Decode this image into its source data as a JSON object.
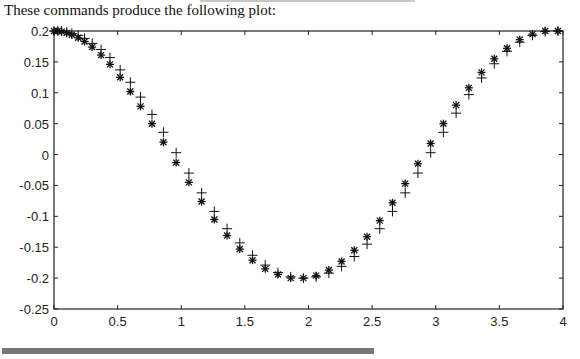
{
  "caption": "These commands produce the following plot:",
  "chart_data": {
    "type": "scatter",
    "title": "",
    "xlabel": "",
    "ylabel": "",
    "xlim": [
      0,
      4
    ],
    "ylim": [
      -0.25,
      0.2
    ],
    "grid": false,
    "legend": null,
    "x_ticks": [
      "0",
      "0.5",
      "1",
      "1.5",
      "2",
      "2.5",
      "3",
      "3.5",
      "4"
    ],
    "y_ticks": [
      "0.2",
      "0.15",
      "0.1",
      "0.05",
      "0",
      "-0.05",
      "-0.1",
      "-0.15",
      "-0.2",
      "-0.25"
    ],
    "series": [
      {
        "name": "star-markers",
        "marker": "*",
        "x": [
          0,
          0.03,
          0.06,
          0.1,
          0.14,
          0.19,
          0.24,
          0.3,
          0.37,
          0.44,
          0.52,
          0.6,
          0.68,
          0.77,
          0.86,
          0.96,
          1.06,
          1.16,
          1.26,
          1.36,
          1.46,
          1.56,
          1.66,
          1.76,
          1.86,
          1.96,
          2.06,
          2.16,
          2.26,
          2.36,
          2.46,
          2.56,
          2.66,
          2.76,
          2.86,
          2.96,
          3.06,
          3.16,
          3.26,
          3.36,
          3.46,
          3.56,
          3.66,
          3.76,
          3.86,
          3.96
        ],
        "y": [
          0.2,
          0.2,
          0.199,
          0.197,
          0.194,
          0.189,
          0.183,
          0.174,
          0.161,
          0.146,
          0.125,
          0.102,
          0.078,
          0.05,
          0.02,
          -0.013,
          -0.045,
          -0.076,
          -0.105,
          -0.131,
          -0.153,
          -0.171,
          -0.185,
          -0.194,
          -0.2,
          -0.2,
          -0.196,
          -0.187,
          -0.173,
          -0.155,
          -0.133,
          -0.107,
          -0.078,
          -0.047,
          -0.015,
          0.018,
          0.05,
          0.08,
          0.108,
          0.133,
          0.155,
          0.172,
          0.186,
          0.195,
          0.2,
          0.2
        ]
      },
      {
        "name": "plus-markers",
        "marker": "+",
        "x": [
          0,
          0.03,
          0.06,
          0.1,
          0.14,
          0.19,
          0.24,
          0.3,
          0.37,
          0.44,
          0.52,
          0.6,
          0.68,
          0.77,
          0.86,
          0.96,
          1.06,
          1.16,
          1.26,
          1.36,
          1.46,
          1.56,
          1.66,
          1.76,
          1.86,
          1.96,
          2.06,
          2.16,
          2.26,
          2.36,
          2.46,
          2.56,
          2.66,
          2.76,
          2.86,
          2.96,
          3.06,
          3.16,
          3.26,
          3.36,
          3.46,
          3.56,
          3.66,
          3.76,
          3.86,
          3.96
        ],
        "y": [
          0.2,
          0.2,
          0.2,
          0.198,
          0.196,
          0.193,
          0.188,
          0.18,
          0.17,
          0.157,
          0.137,
          0.117,
          0.093,
          0.065,
          0.036,
          0.003,
          -0.03,
          -0.062,
          -0.092,
          -0.12,
          -0.143,
          -0.163,
          -0.179,
          -0.191,
          -0.198,
          -0.2,
          -0.198,
          -0.192,
          -0.181,
          -0.165,
          -0.145,
          -0.12,
          -0.092,
          -0.062,
          -0.03,
          0.003,
          0.036,
          0.067,
          0.097,
          0.124,
          0.147,
          0.167,
          0.182,
          0.193,
          0.199,
          0.2
        ]
      }
    ]
  },
  "decor": {
    "bar_color": "#777777"
  }
}
